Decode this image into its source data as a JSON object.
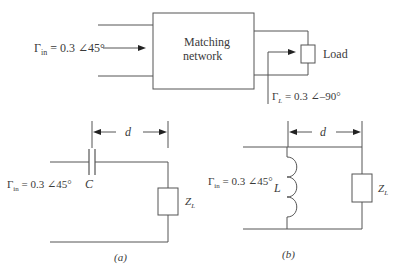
{
  "figure": {
    "top": {
      "input_reflection": {
        "symbol": "Γ",
        "subscript": "in",
        "value": " = 0.3 ∠45°"
      },
      "network_label_line1": "Matching",
      "network_label_line2": "network",
      "load_label": "Load",
      "load_reflection": {
        "symbol": "Γ",
        "subscript": "L",
        "value": " = 0.3 ∠–90°"
      }
    },
    "circuit_a": {
      "input_reflection": {
        "symbol": "Γ",
        "subscript": "in",
        "value": " = 0.3 ∠45°"
      },
      "distance_label": "d",
      "component_label": "C",
      "load_label": {
        "symbol": "Z",
        "subscript": "L"
      },
      "caption": "(a)"
    },
    "circuit_b": {
      "input_reflection": {
        "symbol": "Γ",
        "subscript": "in",
        "value": " = 0.3 ∠45°"
      },
      "distance_label": "d",
      "component_label": "L",
      "load_label": {
        "symbol": "Z",
        "subscript": "L"
      },
      "caption": "(b)"
    }
  }
}
